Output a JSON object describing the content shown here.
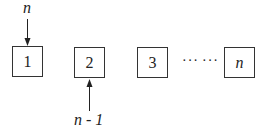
{
  "diagram": {
    "boxes": [
      {
        "label": "1"
      },
      {
        "label": "2"
      },
      {
        "label": "3"
      },
      {
        "label": "n"
      }
    ],
    "ellipsis_1": "···",
    "ellipsis_2": "···",
    "top_pointer_label": "n",
    "bottom_pointer_label": "n - 1"
  }
}
